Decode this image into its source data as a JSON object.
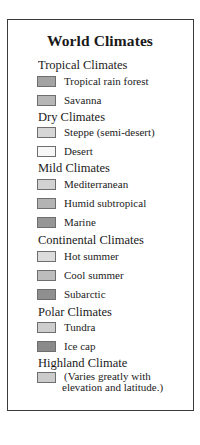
{
  "legend": {
    "title": "World Climates",
    "groups": [
      {
        "name": "Tropical Climates",
        "items": [
          {
            "label": "Tropical rain forest",
            "color": "#a3a3a3"
          },
          {
            "label": "Savanna",
            "color": "#b6b6b6"
          }
        ]
      },
      {
        "name": "Dry Climates",
        "items": [
          {
            "label": "Steppe (semi-desert)",
            "color": "#d6d6d6"
          },
          {
            "label": "Desert",
            "color": "#f7f7f7"
          }
        ]
      },
      {
        "name": "Mild Climates",
        "items": [
          {
            "label": "Mediterranean",
            "color": "#d2d2d2"
          },
          {
            "label": "Humid subtropical",
            "color": "#b3b3b3"
          },
          {
            "label": "Marine",
            "color": "#969696"
          }
        ]
      },
      {
        "name": "Continental Climates",
        "items": [
          {
            "label": "Hot summer",
            "color": "#dcdcdc"
          },
          {
            "label": "Cool summer",
            "color": "#bdbdbd"
          },
          {
            "label": "Subarctic",
            "color": "#8f8f8f"
          }
        ]
      },
      {
        "name": "Polar Climates",
        "items": [
          {
            "label": "Tundra",
            "color": "#cdcdcd"
          },
          {
            "label": "Ice cap",
            "color": "#8a8a8a"
          }
        ]
      },
      {
        "name": "Highland Climate",
        "items": [
          {
            "label_line1": "(Varies greatly with",
            "label_line2": "elevation and latitude.)",
            "color": "#cbcbcb"
          }
        ]
      }
    ]
  }
}
